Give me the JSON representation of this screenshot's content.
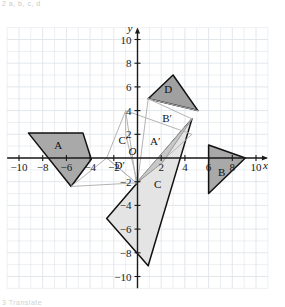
{
  "notes": {
    "top": "2  a, b, c, d",
    "bottom": "3  Translate"
  },
  "axes": {
    "x_name": "x",
    "y_name": "y",
    "origin_label": "O",
    "x_ticks": [
      -10,
      -8,
      -6,
      -4,
      -2,
      2,
      4,
      6,
      8,
      10
    ],
    "y_ticks": [
      -10,
      -8,
      -6,
      -4,
      -2,
      2,
      4,
      6,
      8,
      10
    ],
    "x_tick_labels": [
      "-10",
      "-8",
      "-6",
      "-4",
      "-2",
      "2",
      "4",
      "6",
      "8",
      "10"
    ],
    "y_tick_labels": [
      "-10",
      "-8",
      "-6",
      "-4",
      "-2",
      "2",
      "4",
      "6",
      "8",
      "10"
    ],
    "xlim": [
      -11,
      11
    ],
    "ylim": [
      -11,
      11
    ],
    "grid": true
  },
  "colors": {
    "grid": "#dfe4ea",
    "axis": "#1a1a1a",
    "fill_mid": "#a9a9a9",
    "fill_dark": "#999999",
    "fill_light": "#dcdcdc",
    "outline_dark": "#111111",
    "outline_light": "#b4b4b4"
  },
  "chart_data": {
    "type": "scatter",
    "title": "",
    "xlabel": "x",
    "ylabel": "y",
    "xlim": [
      -11,
      11
    ],
    "ylim": [
      -11,
      11
    ],
    "grid": true,
    "shapes": [
      {
        "name": "A",
        "label": "A",
        "label_at": [
          -6.7,
          0.8
        ],
        "kind": "quadrilateral",
        "points": [
          [
            -9.2,
            2.1
          ],
          [
            -4.6,
            2.1
          ],
          [
            -3.9,
            -0.1
          ],
          [
            -5.6,
            -2.4
          ]
        ],
        "fill": "#a9a9a9",
        "stroke": "#111111"
      },
      {
        "name": "B",
        "label": "B",
        "label_at": [
          7.1,
          -1.5
        ],
        "kind": "triangle",
        "points": [
          [
            6.0,
            1.1
          ],
          [
            9.1,
            0.0
          ],
          [
            6.0,
            -3.0
          ]
        ],
        "fill": "#a9a9a9",
        "stroke": "#111111"
      },
      {
        "name": "C",
        "label": "C",
        "label_at": [
          1.7,
          -2.5
        ],
        "kind": "triangle",
        "points": [
          [
            -2.6,
            -5.1
          ],
          [
            0.9,
            -9.1
          ],
          [
            4.6,
            3.3
          ]
        ],
        "fill": "#e4e4e4",
        "stroke": "#111111"
      },
      {
        "name": "D",
        "label": "D",
        "label_at": [
          2.6,
          5.5
        ],
        "kind": "triangle",
        "points": [
          [
            0.9,
            5.0
          ],
          [
            3.0,
            7.0
          ],
          [
            5.1,
            4.0
          ]
        ],
        "fill": "#a0a0a0",
        "stroke": "#111111"
      }
    ],
    "image_shapes": [
      {
        "name": "A-prime",
        "label": "A′",
        "label_at": [
          1.5,
          1.1
        ],
        "kind": "quadrilateral",
        "points": [
          [
            -1.0,
            4.0
          ],
          [
            -1.0,
            2.0
          ],
          [
            0.0,
            -2.1
          ],
          [
            4.6,
            2.0
          ]
        ],
        "fill": "none",
        "stroke": "#b4b4b4"
      },
      {
        "name": "B-prime",
        "label": "B′",
        "label_at": [
          2.5,
          3.0
        ],
        "kind": "triangle",
        "points": [
          [
            0.9,
            5.0
          ],
          [
            4.6,
            3.3
          ],
          [
            0.0,
            -2.1
          ]
        ],
        "fill": "none",
        "stroke": "#b4b4b4"
      },
      {
        "name": "C-prime",
        "label": "C′",
        "label_at": [
          -1.2,
          1.2
        ],
        "kind": "triangle",
        "points": [
          [
            -1.0,
            4.0
          ],
          [
            -2.6,
            0.0
          ],
          [
            -0.1,
            -2.1
          ]
        ],
        "fill": "none",
        "stroke": "#b4b4b4"
      },
      {
        "name": "D-prime",
        "label": "D′",
        "label_at": [
          -1.5,
          -0.9
        ],
        "kind": "triangle",
        "points": [
          [
            -5.6,
            -2.4
          ],
          [
            -2.6,
            0.0
          ],
          [
            -0.1,
            -2.1
          ]
        ],
        "fill": "none",
        "stroke": "#b4b4b4"
      },
      {
        "name": "C-inner",
        "label": "",
        "label_at": [
          0,
          0
        ],
        "kind": "triangle",
        "points": [
          [
            -0.2,
            -2.2
          ],
          [
            2.1,
            -0.4
          ],
          [
            4.6,
            3.3
          ]
        ],
        "fill": "#c8c8c8",
        "stroke": "#9a9a9a"
      },
      {
        "name": "ray-d-left",
        "label": "",
        "label_at": [
          0,
          0
        ],
        "kind": "polyline",
        "points": [
          [
            0.9,
            5.0
          ],
          [
            5.1,
            4.0
          ]
        ],
        "fill": "none",
        "stroke": "#b4b4b4"
      }
    ]
  }
}
